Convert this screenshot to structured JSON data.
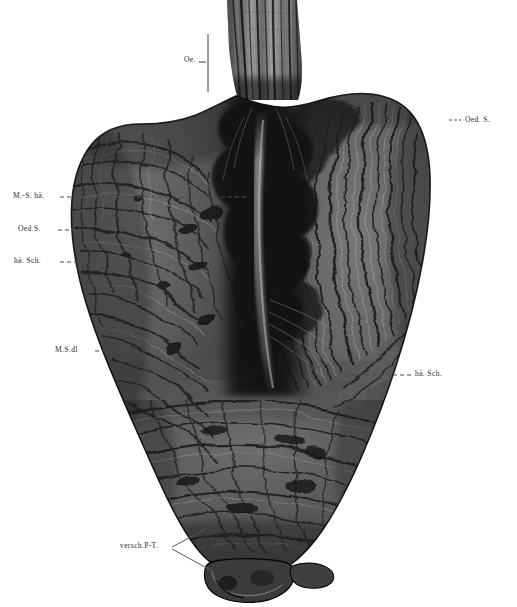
{
  "plate": {
    "title": "Opened stomach specimen, anterior wall reflected",
    "medium": "monochrome anatomical photograph",
    "background_color": "#ffffff",
    "ink_color": "#2b2b2b"
  },
  "annotations": [
    {
      "id": "oe",
      "text": "Oe.",
      "meaning": "Oesophagus",
      "position": "top-center-left",
      "leader": "vertical-bar",
      "x": 186,
      "y": 60
    },
    {
      "id": "oed-s-right",
      "text": "Oed. S.",
      "meaning": "oedematoese Schleimhaut",
      "position": "upper-right",
      "leader": "short-dash",
      "x": 466,
      "y": 121
    },
    {
      "id": "ms-hae",
      "text": "M.-S. hä.",
      "meaning": "Magen-Schleimhaut, haemorrhagisch",
      "position": "left-upper",
      "leader": "long-dash",
      "x": 14,
      "y": 193
    },
    {
      "id": "oed-s-left",
      "text": "Oed.S.",
      "meaning": "oedematoese Schleimhaut",
      "position": "left-middle",
      "leader": "long-dash",
      "x": 18,
      "y": 226
    },
    {
      "id": "hae-sch-left",
      "text": "hä. Sch.",
      "meaning": "haemorrhagische Schleimhaut",
      "position": "left-lower-middle",
      "leader": "long-dash",
      "x": 14,
      "y": 258
    },
    {
      "id": "ms-dl",
      "text": "M.S.dl",
      "meaning": "Magen-Schleimhaut, duenn",
      "position": "left-lower",
      "leader": "long-dash",
      "x": 55,
      "y": 347
    },
    {
      "id": "hae-sch-right",
      "text": "hä. Sch.",
      "meaning": "haemorrhagische Schleimhaut",
      "position": "right-lower",
      "leader": "long-dash",
      "x": 416,
      "y": 371
    },
    {
      "id": "versch-pt",
      "text": "versch.P-T.",
      "meaning": "verschlossener Pylorus-Teil",
      "position": "bottom-left",
      "leader": "diagonal",
      "x": 121,
      "y": 543
    }
  ],
  "specimen": {
    "regions": [
      {
        "name": "oesophagus",
        "label_ref": "oe",
        "description": "vertical longitudinal mucosal folds, mid-grey"
      },
      {
        "name": "cardia",
        "description": "dark converging junction below oesophagus"
      },
      {
        "name": "left-wall",
        "label_ref": "ms-hae",
        "description": "broad lobe with dense reticular rugae"
      },
      {
        "name": "right-wall",
        "label_ref": "oed-s-right",
        "description": "long sweeping vertical rugal folds"
      },
      {
        "name": "lesser-curvature-channel",
        "description": "deep near-black central furrow with pale ridge"
      },
      {
        "name": "antrum",
        "description": "coarse transverse folds, mid-lower body"
      },
      {
        "name": "pylorus",
        "label_ref": "versch-pt",
        "description": "small rounded protrusion at lower margin"
      }
    ],
    "tone_range": {
      "darkest": "#050505",
      "mid": "#4a4a4a",
      "lightest": "#cfcfcf"
    }
  }
}
